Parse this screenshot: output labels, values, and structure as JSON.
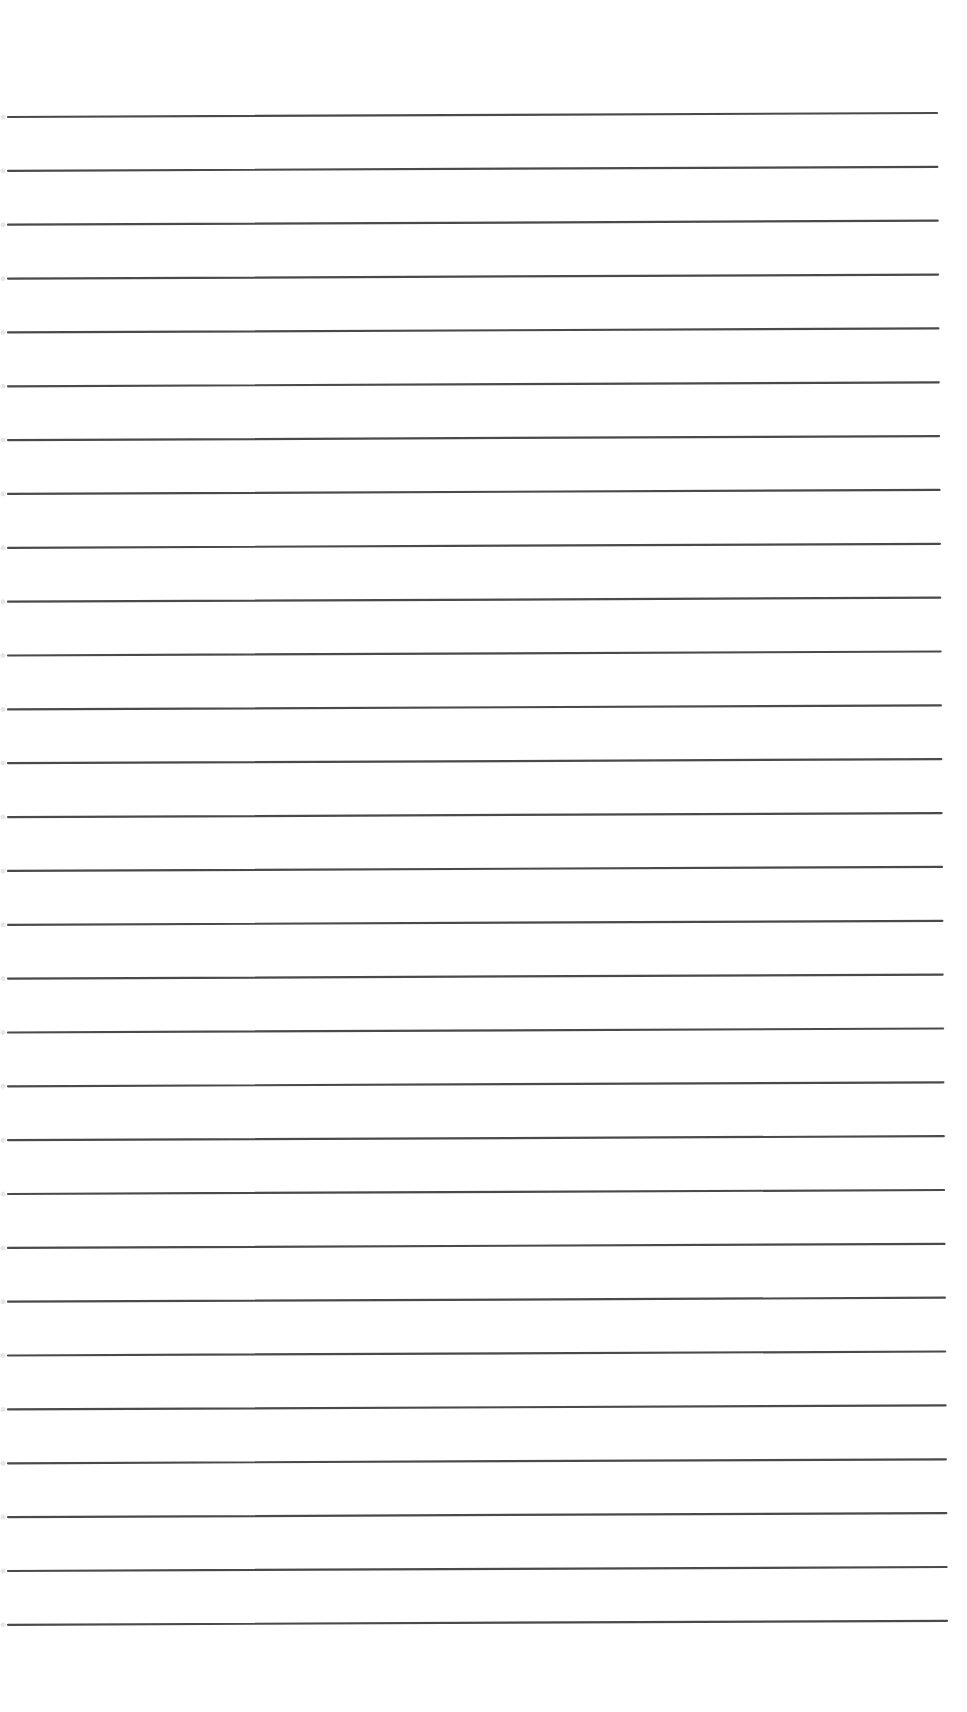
{
  "page": {
    "type": "lined-paper",
    "background": "#ffffff",
    "rule_color": "#4a4a4a",
    "rule_count": 29,
    "first_rule_y": 117,
    "rule_spacing": 53.85,
    "rule_left_x": 8,
    "rule_right_x_top": 937,
    "rule_right_x_bottom": 947,
    "rule_slope_px": -4,
    "text_content": []
  }
}
